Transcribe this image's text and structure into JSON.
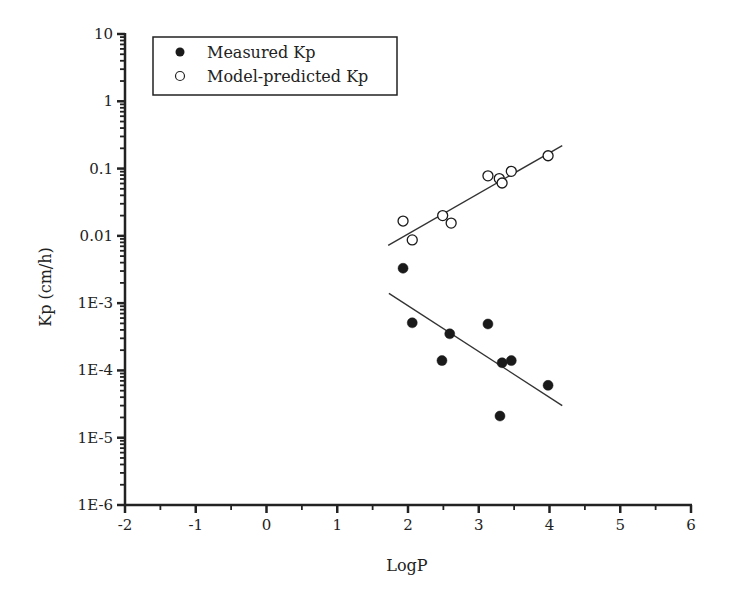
{
  "chart_data": {
    "type": "scatter",
    "title": "",
    "xlabel": "LogP",
    "ylabel": "Kp (cm/h)",
    "xlim": [
      -2,
      6
    ],
    "ylim": [
      1e-06,
      10
    ],
    "yscale": "log",
    "grid": false,
    "legend_position": "upper left",
    "x_ticks": [
      -2,
      -1,
      0,
      1,
      2,
      3,
      4,
      5,
      6
    ],
    "x_tick_labels": [
      "-2",
      "-1",
      "0",
      "1",
      "2",
      "3",
      "4",
      "5",
      "6"
    ],
    "y_ticks": [
      10,
      1,
      0.1,
      0.01,
      0.001,
      0.0001,
      1e-05,
      1e-06
    ],
    "y_tick_labels": [
      "10",
      "1",
      "0.1",
      "0.01",
      "1E-3",
      "1E-4",
      "1E-5",
      "1E-6"
    ],
    "series": [
      {
        "name": "Measured Kp",
        "marker": "filled-circle",
        "color": "#1a1a1a",
        "x": [
          1.93,
          2.06,
          2.48,
          2.59,
          3.13,
          3.3,
          3.33,
          3.46,
          3.98
        ],
        "y": [
          0.0033,
          0.00051,
          0.00014,
          0.00035,
          0.00049,
          2.1e-05,
          0.00013,
          0.00014,
          6e-05
        ],
        "trendline": {
          "x": [
            1.73,
            4.18
          ],
          "y": [
            0.0014,
            3e-05
          ]
        }
      },
      {
        "name": "Model-predicted Kp",
        "marker": "open-circle",
        "color": "#1a1a1a",
        "x": [
          1.93,
          2.06,
          2.49,
          2.61,
          3.13,
          3.29,
          3.33,
          3.46,
          3.98
        ],
        "y": [
          0.0166,
          0.0087,
          0.02,
          0.0155,
          0.078,
          0.071,
          0.061,
          0.091,
          0.155
        ],
        "trendline": {
          "x": [
            1.72,
            4.18
          ],
          "y": [
            0.0072,
            0.22
          ]
        }
      }
    ]
  },
  "legend": {
    "items": [
      {
        "label": "Measured Kp",
        "marker": "filled-circle"
      },
      {
        "label": "Model-predicted Kp",
        "marker": "open-circle"
      }
    ]
  }
}
